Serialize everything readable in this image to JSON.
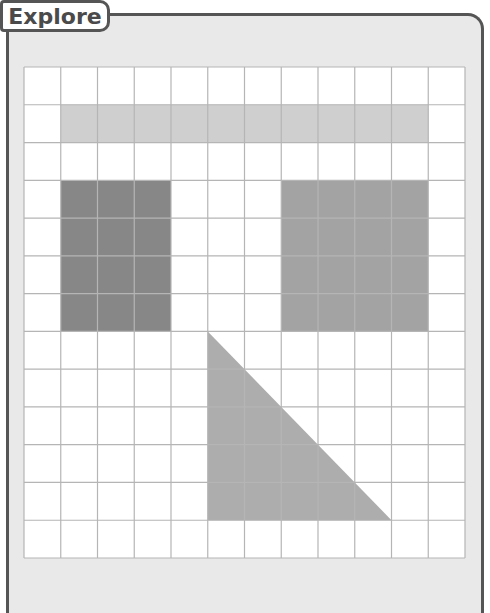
{
  "header": {
    "label": "Explore"
  },
  "grid": {
    "columns": 12,
    "rows": 13,
    "origin_px": [
      24,
      67
    ],
    "cell_w": 36.75,
    "cell_h": 37.77,
    "line_color": "#b5b5b5",
    "fill_white": "#ffffff"
  },
  "shapes": [
    {
      "name": "light-bar",
      "type": "rect",
      "col": 1,
      "row": 1,
      "cols": 10,
      "rows": 1,
      "color": "#cfcfcf"
    },
    {
      "name": "dark-rectangle",
      "type": "rect",
      "col": 1,
      "row": 3,
      "cols": 3,
      "rows": 4,
      "color": "#878787"
    },
    {
      "name": "medium-square",
      "type": "rect",
      "col": 7,
      "row": 3,
      "cols": 4,
      "rows": 4,
      "color": "#a3a3a3"
    },
    {
      "name": "right-triangle",
      "type": "triangle",
      "points_cells": [
        [
          5,
          7
        ],
        [
          5,
          12
        ],
        [
          10,
          12
        ]
      ],
      "color": "#adadad"
    }
  ]
}
